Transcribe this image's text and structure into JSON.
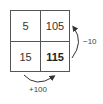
{
  "grid": {
    "cells": [
      {
        "value": "5",
        "bold": false
      },
      {
        "value": "105",
        "bold": false
      },
      {
        "value": "15",
        "bold": false
      },
      {
        "value": "115",
        "bold": true
      }
    ]
  },
  "arrows": [
    {
      "from": "115",
      "to": "105",
      "label": "−10"
    },
    {
      "from": "15",
      "to": "115",
      "label": "+100"
    }
  ]
}
